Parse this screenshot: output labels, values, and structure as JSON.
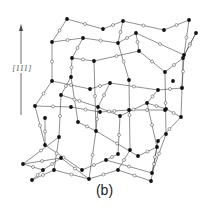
{
  "figure": {
    "caption": "(b)",
    "axis": {
      "label": "[111]",
      "direction": "up"
    }
  },
  "colors": {
    "line": "#444444",
    "atom_black": "#111111",
    "atom_white": "#ffffff",
    "label": "#555555"
  },
  "lattice": {
    "black_nodes": [
      [
        67,
        19
      ],
      [
        103,
        29
      ],
      [
        123,
        21
      ],
      [
        164,
        30
      ],
      [
        189,
        20
      ],
      [
        52,
        42
      ],
      [
        83,
        38
      ],
      [
        118,
        43
      ],
      [
        136,
        33
      ],
      [
        184,
        55
      ],
      [
        196,
        33
      ],
      [
        72,
        58
      ],
      [
        94,
        61
      ],
      [
        139,
        51
      ],
      [
        165,
        72
      ],
      [
        183,
        58
      ],
      [
        52,
        81
      ],
      [
        71,
        77
      ],
      [
        90,
        89
      ],
      [
        110,
        83
      ],
      [
        129,
        80
      ],
      [
        158,
        90
      ],
      [
        173,
        81
      ],
      [
        35,
        106
      ],
      [
        61,
        95
      ],
      [
        98,
        107
      ],
      [
        120,
        116
      ],
      [
        147,
        103
      ],
      [
        181,
        117
      ],
      [
        166,
        109
      ],
      [
        45,
        118
      ],
      [
        71,
        107
      ],
      [
        100,
        112
      ],
      [
        129,
        110
      ],
      [
        165,
        110
      ],
      [
        182,
        88
      ],
      [
        45,
        145
      ],
      [
        59,
        137
      ],
      [
        78,
        122
      ],
      [
        96,
        131
      ],
      [
        118,
        154
      ],
      [
        138,
        156
      ],
      [
        157,
        147
      ],
      [
        166,
        134
      ],
      [
        23,
        164
      ],
      [
        43,
        170
      ],
      [
        61,
        158
      ],
      [
        82,
        170
      ],
      [
        106,
        160
      ],
      [
        130,
        150
      ],
      [
        152,
        173
      ],
      [
        158,
        141
      ],
      [
        32,
        180
      ],
      [
        54,
        170
      ],
      [
        89,
        179
      ],
      [
        118,
        170
      ],
      [
        151,
        181
      ]
    ],
    "bonds": [
      [
        [
          67,
          19
        ],
        [
          103,
          29
        ]
      ],
      [
        [
          103,
          29
        ],
        [
          123,
          21
        ]
      ],
      [
        [
          123,
          21
        ],
        [
          164,
          30
        ]
      ],
      [
        [
          164,
          30
        ],
        [
          189,
          20
        ]
      ],
      [
        [
          67,
          19
        ],
        [
          52,
          42
        ]
      ],
      [
        [
          123,
          21
        ],
        [
          118,
          43
        ]
      ],
      [
        [
          189,
          20
        ],
        [
          184,
          55
        ]
      ],
      [
        [
          52,
          42
        ],
        [
          83,
          38
        ]
      ],
      [
        [
          83,
          38
        ],
        [
          118,
          43
        ]
      ],
      [
        [
          118,
          43
        ],
        [
          136,
          33
        ]
      ],
      [
        [
          136,
          33
        ],
        [
          184,
          55
        ]
      ],
      [
        [
          184,
          55
        ],
        [
          196,
          33
        ]
      ],
      [
        [
          83,
          38
        ],
        [
          72,
          58
        ]
      ],
      [
        [
          136,
          33
        ],
        [
          139,
          51
        ]
      ],
      [
        [
          196,
          33
        ],
        [
          183,
          58
        ]
      ],
      [
        [
          72,
          58
        ],
        [
          94,
          61
        ]
      ],
      [
        [
          94,
          61
        ],
        [
          139,
          51
        ]
      ],
      [
        [
          139,
          51
        ],
        [
          165,
          72
        ]
      ],
      [
        [
          165,
          72
        ],
        [
          183,
          58
        ]
      ],
      [
        [
          52,
          42
        ],
        [
          52,
          81
        ]
      ],
      [
        [
          72,
          58
        ],
        [
          71,
          77
        ]
      ],
      [
        [
          118,
          43
        ],
        [
          129,
          80
        ]
      ],
      [
        [
          184,
          55
        ],
        [
          182,
          88
        ]
      ],
      [
        [
          183,
          58
        ],
        [
          181,
          117
        ]
      ],
      [
        [
          52,
          81
        ],
        [
          90,
          89
        ]
      ],
      [
        [
          90,
          89
        ],
        [
          110,
          83
        ]
      ],
      [
        [
          110,
          83
        ],
        [
          158,
          90
        ]
      ],
      [
        [
          158,
          90
        ],
        [
          182,
          88
        ]
      ],
      [
        [
          71,
          77
        ],
        [
          61,
          95
        ]
      ],
      [
        [
          110,
          83
        ],
        [
          98,
          107
        ]
      ],
      [
        [
          158,
          90
        ],
        [
          147,
          103
        ]
      ],
      [
        [
          61,
          95
        ],
        [
          98,
          107
        ]
      ],
      [
        [
          98,
          107
        ],
        [
          120,
          116
        ]
      ],
      [
        [
          120,
          116
        ],
        [
          147,
          103
        ]
      ],
      [
        [
          147,
          103
        ],
        [
          166,
          109
        ]
      ],
      [
        [
          166,
          109
        ],
        [
          181,
          117
        ]
      ],
      [
        [
          52,
          81
        ],
        [
          35,
          106
        ]
      ],
      [
        [
          35,
          106
        ],
        [
          71,
          107
        ]
      ],
      [
        [
          71,
          107
        ],
        [
          100,
          112
        ]
      ],
      [
        [
          100,
          112
        ],
        [
          129,
          110
        ]
      ],
      [
        [
          129,
          110
        ],
        [
          165,
          110
        ]
      ],
      [
        [
          71,
          77
        ],
        [
          78,
          122
        ]
      ],
      [
        [
          94,
          61
        ],
        [
          96,
          131
        ]
      ],
      [
        [
          129,
          80
        ],
        [
          130,
          150
        ]
      ],
      [
        [
          165,
          72
        ],
        [
          166,
          134
        ]
      ],
      [
        [
          35,
          106
        ],
        [
          45,
          145
        ]
      ],
      [
        [
          61,
          95
        ],
        [
          59,
          137
        ]
      ],
      [
        [
          98,
          107
        ],
        [
          96,
          131
        ]
      ],
      [
        [
          120,
          116
        ],
        [
          118,
          154
        ]
      ],
      [
        [
          147,
          103
        ],
        [
          157,
          147
        ]
      ],
      [
        [
          181,
          117
        ],
        [
          158,
          141
        ]
      ],
      [
        [
          45,
          118
        ],
        [
          45,
          145
        ]
      ],
      [
        [
          78,
          122
        ],
        [
          96,
          131
        ]
      ],
      [
        [
          96,
          131
        ],
        [
          138,
          156
        ]
      ],
      [
        [
          138,
          156
        ],
        [
          157,
          147
        ]
      ],
      [
        [
          45,
          145
        ],
        [
          82,
          170
        ]
      ],
      [
        [
          82,
          170
        ],
        [
          106,
          160
        ]
      ],
      [
        [
          106,
          160
        ],
        [
          152,
          173
        ]
      ],
      [
        [
          152,
          173
        ],
        [
          166,
          134
        ]
      ],
      [
        [
          59,
          137
        ],
        [
          23,
          164
        ]
      ],
      [
        [
          23,
          164
        ],
        [
          61,
          158
        ]
      ],
      [
        [
          61,
          158
        ],
        [
          89,
          179
        ]
      ],
      [
        [
          89,
          179
        ],
        [
          118,
          170
        ]
      ],
      [
        [
          118,
          170
        ],
        [
          151,
          181
        ]
      ],
      [
        [
          59,
          137
        ],
        [
          54,
          170
        ]
      ],
      [
        [
          96,
          131
        ],
        [
          89,
          179
        ]
      ],
      [
        [
          130,
          150
        ],
        [
          118,
          170
        ]
      ],
      [
        [
          157,
          147
        ],
        [
          151,
          181
        ]
      ],
      [
        [
          23,
          164
        ],
        [
          43,
          170
        ]
      ],
      [
        [
          43,
          170
        ],
        [
          32,
          180
        ]
      ],
      [
        [
          32,
          180
        ],
        [
          54,
          170
        ]
      ],
      [
        [
          54,
          170
        ],
        [
          89,
          179
        ]
      ],
      [
        [
          61,
          158
        ],
        [
          43,
          170
        ]
      ],
      [
        [
          106,
          160
        ],
        [
          118,
          154
        ]
      ],
      [
        [
          158,
          141
        ],
        [
          152,
          173
        ]
      ]
    ]
  }
}
